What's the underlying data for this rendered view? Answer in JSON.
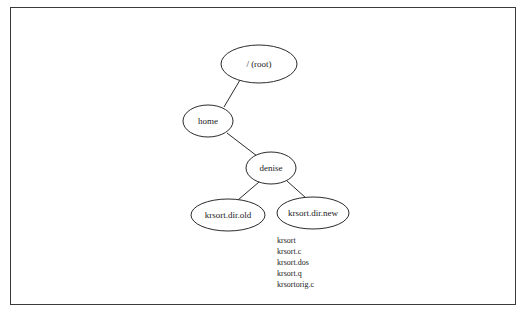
{
  "diagram": {
    "type": "tree",
    "title": "",
    "frame": {
      "border_color": "#3a3a3a",
      "background": "#ffffff"
    },
    "node_stroke_color": "#2b2b2b",
    "text_color": "#1a1a1a",
    "nodes": [
      {
        "id": "root",
        "label": "/ (root)",
        "cx": 259,
        "cy": 64,
        "rx": 38,
        "ry": 19,
        "font_size": 9
      },
      {
        "id": "home",
        "label": "home",
        "cx": 208,
        "cy": 121,
        "rx": 25,
        "ry": 16,
        "font_size": 9
      },
      {
        "id": "denise",
        "label": "denise",
        "cx": 271,
        "cy": 168,
        "rx": 25,
        "ry": 16,
        "font_size": 9
      },
      {
        "id": "krsort_old",
        "label": "krsort.dir.old",
        "cx": 228,
        "cy": 215,
        "rx": 37,
        "ry": 16,
        "font_size": 9
      },
      {
        "id": "krsort_new",
        "label": "krsort.dir.new",
        "cx": 313,
        "cy": 213,
        "rx": 36,
        "ry": 16,
        "font_size": 9
      }
    ],
    "edges": [
      {
        "from": "root",
        "to": "home",
        "x1": 240,
        "y1": 80,
        "x2": 224,
        "y2": 107
      },
      {
        "from": "home",
        "to": "denise",
        "x1": 227,
        "y1": 133,
        "x2": 257,
        "y2": 156
      },
      {
        "from": "denise",
        "to": "krsort_old",
        "x1": 259,
        "y1": 182,
        "x2": 238,
        "y2": 200
      },
      {
        "from": "denise",
        "to": "krsort_new",
        "x1": 287,
        "y1": 181,
        "x2": 306,
        "y2": 198
      }
    ],
    "file_list": {
      "x": 277,
      "y_start": 243,
      "line_height": 11,
      "font_size": 8,
      "items": [
        "krsort",
        "krsort.c",
        "krsort.dos",
        "krsort.q",
        "krsortorig.c"
      ]
    }
  }
}
